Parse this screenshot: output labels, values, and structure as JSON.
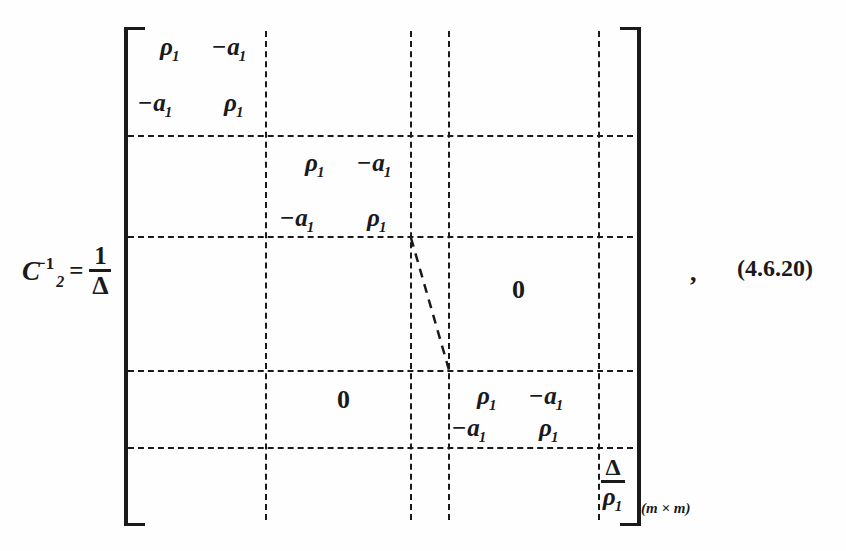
{
  "equation": {
    "label": "(4.6.20)",
    "trailing_punctuation": ",",
    "lhs": {
      "matrix_symbol": "C",
      "matrix_subscript": "2",
      "matrix_superscript": "−1",
      "equals": "=",
      "scalar_factor": {
        "numerator": "1",
        "denominator": "Δ"
      }
    },
    "matrix": {
      "dimensions_label": "(m × m)",
      "bracket_style": "square",
      "partition_style": "dashed",
      "blocks": [
        {
          "position": "block-1",
          "row": 1,
          "col": 1,
          "type": "2x2-diagonal-block",
          "cells": [
            {
              "value": "ρ",
              "subscript": "1",
              "negative": false
            },
            {
              "value": "a",
              "subscript": "1",
              "negative": true
            },
            {
              "value": "a",
              "subscript": "1",
              "negative": true
            },
            {
              "value": "ρ",
              "subscript": "1",
              "negative": false
            }
          ]
        },
        {
          "position": "block-2",
          "row": 2,
          "col": 2,
          "type": "2x2-diagonal-block",
          "cells": [
            {
              "value": "ρ",
              "subscript": "1",
              "negative": false
            },
            {
              "value": "a",
              "subscript": "1",
              "negative": true
            },
            {
              "value": "a",
              "subscript": "1",
              "negative": true
            },
            {
              "value": "ρ",
              "subscript": "1",
              "negative": false
            }
          ]
        },
        {
          "position": "block-3",
          "row": 4,
          "col": 4,
          "type": "2x2-diagonal-block",
          "cells": [
            {
              "value": "ρ",
              "subscript": "1",
              "negative": false
            },
            {
              "value": "a",
              "subscript": "1",
              "negative": true
            },
            {
              "value": "a",
              "subscript": "1",
              "negative": true
            },
            {
              "value": "ρ",
              "subscript": "1",
              "negative": false
            }
          ]
        },
        {
          "position": "corner",
          "row": 5,
          "col": 5,
          "type": "scalar",
          "numerator": "Δ",
          "denominator": "ρ",
          "denominator_subscript": "1"
        }
      ],
      "zero_blocks": [
        {
          "position": "upper-right",
          "label": "0"
        },
        {
          "position": "lower-left",
          "label": "0"
        }
      ],
      "ellipsis": {
        "type": "diagonal-dashed",
        "meaning": "continuation-of-diagonal-blocks"
      }
    }
  },
  "glyphs": {
    "rho": "ρ",
    "delta": "Δ",
    "minus": "−",
    "times": "×",
    "a": "a",
    "one": "1",
    "zero": "0"
  }
}
